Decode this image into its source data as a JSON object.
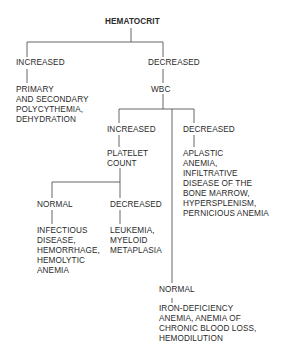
{
  "diagram": {
    "title": "HEMATOCRIT",
    "level1": {
      "increased": {
        "label": "INCREASED",
        "result": [
          "PRIMARY",
          "AND SECONDARY",
          "POLYCYTHEMIA,",
          "DEHYDRATION"
        ]
      },
      "decreased": {
        "label": "DECREASED",
        "next": "WBC"
      }
    },
    "wbc": {
      "increased": {
        "label": "INCREASED",
        "next": [
          "PLATELET",
          "COUNT"
        ]
      },
      "decreased": {
        "label": "DECREASED",
        "result": [
          "APLASTIC",
          "ANEMIA,",
          "INFILTRATIVE",
          "DISEASE OF THE",
          "BONE MARROW,",
          "HYPERSPLENISM,",
          "PERNICIOUS ANEMIA"
        ]
      },
      "normal": {
        "label": "NORMAL",
        "result": [
          "IRON-DEFICIENCY",
          "ANEMIA, ANEMIA OF",
          "CHRONIC BLOOD LOSS,",
          "HEMODILUTION"
        ]
      }
    },
    "platelet": {
      "normal": {
        "label": "NORMAL",
        "result": [
          "INFECTIOUS",
          "DISEASE,",
          "HEMORRHAGE,",
          "HEMOLYTIC",
          "ANEMIA"
        ]
      },
      "decreased": {
        "label": "DECREASED",
        "result": [
          "LEUKEMIA,",
          "MYELOID",
          "METAPLASIA"
        ]
      }
    }
  }
}
